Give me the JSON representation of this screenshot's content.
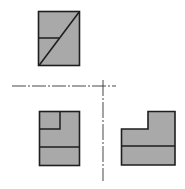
{
  "diagram": {
    "type": "orthographic-projection",
    "colors": {
      "fill": "#a9a9a9",
      "stroke": "#1e1e1e",
      "centerline": "#333333",
      "background": "#ffffff"
    },
    "views": [
      {
        "name": "top-view",
        "shape": "rectangle with horizontal line and diagonal"
      },
      {
        "name": "front-view",
        "shape": "rectangle with inner notch and horizontal line"
      },
      {
        "name": "side-view",
        "shape": "L-shaped profile with horizontal line"
      }
    ],
    "centerlines": [
      {
        "name": "horizontal-centerline",
        "style": "dash-dot"
      },
      {
        "name": "vertical-centerline",
        "style": "dash-dot"
      }
    ]
  }
}
